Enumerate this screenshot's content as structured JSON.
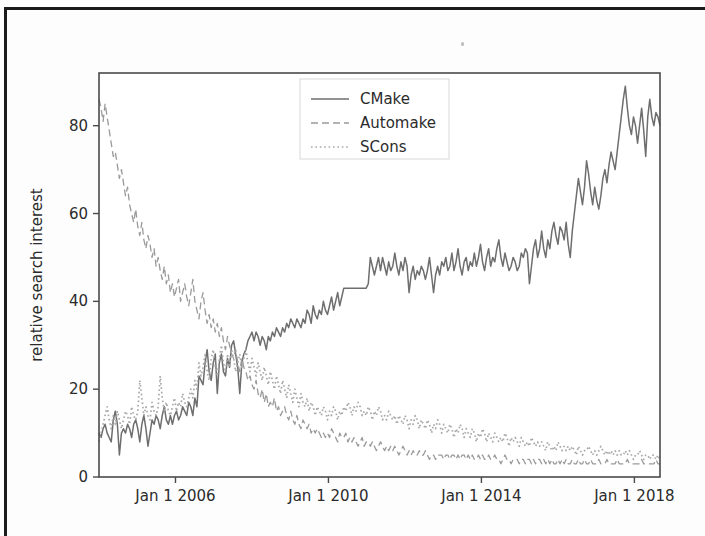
{
  "figure": {
    "background_color": "#fdfdfd",
    "frame_color": "#4a4a4a",
    "page_border_color": "#1b1b1b"
  },
  "axes": {
    "y_title": "relative search interest",
    "y_ticks": [
      "0",
      "20",
      "40",
      "60",
      "80"
    ],
    "x_ticks": [
      "Jan 1 2006",
      "Jan 1 2010",
      "Jan 1 2014",
      "Jan 1 2018"
    ]
  },
  "legend": {
    "entries": [
      {
        "label": "CMake",
        "style": "solid",
        "color": "#6e6e6e"
      },
      {
        "label": "Automake",
        "style": "dashed",
        "color": "#9a9a9a"
      },
      {
        "label": "SCons",
        "style": "dotted",
        "color": "#a8a8a8"
      }
    ]
  },
  "chart_data": {
    "type": "line",
    "title": "",
    "xlabel": "",
    "ylabel": "relative search interest",
    "xlim": [
      "2004-01-01",
      "2018-09-01"
    ],
    "ylim": [
      0,
      92
    ],
    "yticks": [
      0,
      20,
      40,
      60,
      80
    ],
    "xticks": [
      "Jan 1 2006",
      "Jan 1 2010",
      "Jan 1 2014",
      "Jan 1 2018"
    ],
    "grid": false,
    "legend_position": "upper center",
    "x_start_year": 2004.0,
    "x_end_year": 2018.67,
    "x_step_years": 0.0833,
    "series": [
      {
        "name": "CMake",
        "style": "solid",
        "color": "#6e6e6e",
        "values": [
          10,
          9,
          11,
          12,
          10,
          9,
          8,
          13,
          15,
          12,
          5,
          10,
          11,
          10,
          12,
          11,
          9,
          12,
          13,
          11,
          8,
          12,
          14,
          11,
          7,
          10,
          13,
          12,
          14,
          13,
          11,
          14,
          16,
          13,
          12,
          14,
          12,
          14,
          15,
          13,
          14,
          16,
          15,
          14,
          17,
          16,
          14,
          18,
          16,
          23,
          22,
          21,
          26,
          29,
          24,
          22,
          26,
          28,
          19,
          26,
          28,
          24,
          23,
          27,
          25,
          30,
          31,
          28,
          25,
          19,
          26,
          28,
          29,
          31,
          32,
          33,
          31,
          33,
          32,
          30,
          32,
          31,
          29,
          32,
          31,
          33,
          32,
          34,
          33,
          32,
          34,
          33,
          35,
          34,
          36,
          35,
          34,
          36,
          35,
          34,
          36,
          35,
          38,
          37,
          35,
          39,
          37,
          36,
          38,
          37,
          40,
          38,
          37,
          39,
          41,
          38,
          40,
          42,
          39,
          41,
          43,
          43,
          43,
          43,
          43,
          43,
          43,
          43,
          43,
          43,
          43,
          43,
          44,
          50,
          48,
          46,
          48,
          50,
          47,
          50,
          48,
          46,
          49,
          47,
          48,
          51,
          48,
          46,
          49,
          47,
          50,
          48,
          42,
          46,
          48,
          45,
          47,
          46,
          48,
          47,
          45,
          47,
          50,
          46,
          42,
          46,
          48,
          46,
          49,
          48,
          50,
          47,
          48,
          51,
          47,
          49,
          52,
          48,
          46,
          49,
          50,
          47,
          49,
          48,
          51,
          48,
          50,
          53,
          49,
          47,
          50,
          52,
          48,
          50,
          49,
          52,
          54,
          50,
          48,
          51,
          49,
          47,
          48,
          50,
          49,
          47,
          48,
          51,
          50,
          52,
          51,
          44,
          48,
          52,
          54,
          50,
          52,
          56,
          52,
          50,
          54,
          52,
          56,
          58,
          55,
          53,
          57,
          56,
          54,
          58,
          53,
          50,
          56,
          60,
          64,
          68,
          65,
          62,
          66,
          72,
          69,
          65,
          62,
          66,
          63,
          61,
          64,
          68,
          70,
          67,
          71,
          74,
          72,
          70,
          74,
          78,
          82,
          86,
          89,
          84,
          80,
          78,
          82,
          80,
          76,
          80,
          84,
          79,
          73,
          82,
          86,
          82,
          80,
          83,
          82,
          80
        ]
      },
      {
        "name": "Automake",
        "style": "dashed",
        "color": "#9a9a9a",
        "values": [
          86,
          84,
          81,
          85,
          82,
          79,
          76,
          73,
          74,
          71,
          68,
          70,
          67,
          64,
          66,
          62,
          60,
          58,
          61,
          57,
          55,
          58,
          54,
          52,
          55,
          53,
          50,
          52,
          48,
          50,
          47,
          45,
          48,
          44,
          46,
          42,
          44,
          41,
          43,
          45,
          40,
          42,
          44,
          41,
          39,
          42,
          45,
          40,
          38,
          36,
          40,
          42,
          38,
          35,
          37,
          34,
          36,
          33,
          35,
          32,
          34,
          31,
          29,
          32,
          30,
          28,
          27,
          29,
          26,
          24,
          27,
          25,
          24,
          22,
          23,
          21,
          20,
          22,
          19,
          18,
          20,
          17,
          19,
          16,
          17,
          16,
          18,
          15,
          16,
          14,
          15,
          16,
          14,
          13,
          15,
          13,
          12,
          14,
          12,
          11,
          13,
          12,
          11,
          12,
          10,
          11,
          10,
          11,
          10,
          9,
          10,
          9,
          10,
          9,
          11,
          10,
          9,
          8,
          10,
          9,
          9,
          10,
          8,
          9,
          8,
          9,
          8,
          7,
          8,
          9,
          7,
          8,
          8,
          7,
          8,
          7,
          6,
          7,
          8,
          7,
          6,
          7,
          6,
          7,
          6,
          7,
          6,
          5,
          6,
          7,
          6,
          5,
          6,
          5,
          6,
          5,
          5,
          6,
          5,
          5,
          6,
          5,
          4,
          5,
          5,
          4,
          5,
          5,
          5,
          4,
          5,
          5,
          4,
          5,
          5,
          4,
          5,
          4,
          5,
          5,
          4,
          5,
          4,
          5,
          4,
          4,
          5,
          4,
          5,
          4,
          4,
          5,
          4,
          4,
          5,
          4,
          4,
          3,
          4,
          5,
          4,
          4,
          3,
          4,
          4,
          4,
          3,
          4,
          4,
          3,
          4,
          4,
          3,
          4,
          3,
          4,
          4,
          3,
          4,
          3,
          4,
          3,
          4,
          3,
          3,
          4,
          3,
          4,
          3,
          4,
          3,
          3,
          4,
          3,
          3,
          4,
          3,
          3,
          4,
          3,
          3,
          4,
          3,
          3,
          3,
          4,
          3,
          3,
          3,
          4,
          3,
          3,
          3,
          3,
          4,
          3,
          3,
          3,
          3,
          4,
          3,
          3,
          3,
          3,
          3,
          3,
          4,
          3,
          3,
          3,
          3,
          3,
          3,
          4,
          3,
          3
        ]
      },
      {
        "name": "SCons",
        "style": "dotted",
        "color": "#a8a8a8",
        "values": [
          8,
          10,
          12,
          14,
          16,
          13,
          11,
          14,
          12,
          15,
          13,
          11,
          13,
          15,
          14,
          12,
          16,
          14,
          13,
          15,
          22,
          18,
          14,
          16,
          14,
          13,
          17,
          15,
          14,
          16,
          23,
          18,
          15,
          17,
          15,
          14,
          16,
          18,
          15,
          17,
          16,
          19,
          17,
          16,
          18,
          20,
          18,
          22,
          20,
          26,
          23,
          25,
          28,
          24,
          22,
          27,
          29,
          25,
          23,
          27,
          30,
          26,
          24,
          28,
          25,
          29,
          27,
          24,
          26,
          28,
          25,
          27,
          29,
          26,
          24,
          27,
          25,
          23,
          26,
          24,
          22,
          25,
          23,
          21,
          24,
          22,
          20,
          23,
          21,
          19,
          22,
          20,
          18,
          21,
          19,
          17,
          20,
          18,
          16,
          19,
          17,
          16,
          18,
          15,
          17,
          16,
          14,
          16,
          15,
          14,
          16,
          15,
          13,
          15,
          14,
          16,
          15,
          13,
          15,
          14,
          16,
          15,
          17,
          16,
          14,
          16,
          15,
          17,
          16,
          14,
          15,
          14,
          16,
          15,
          13,
          15,
          14,
          16,
          15,
          13,
          14,
          13,
          15,
          14,
          13,
          14,
          12,
          14,
          13,
          12,
          14,
          13,
          11,
          13,
          12,
          14,
          13,
          11,
          13,
          12,
          11,
          13,
          12,
          10,
          12,
          11,
          13,
          12,
          10,
          12,
          11,
          10,
          12,
          11,
          9,
          11,
          10,
          12,
          11,
          9,
          11,
          10,
          9,
          11,
          10,
          8,
          10,
          9,
          11,
          10,
          8,
          10,
          9,
          8,
          10,
          9,
          8,
          9,
          8,
          10,
          9,
          7,
          9,
          8,
          9,
          8,
          7,
          9,
          8,
          7,
          8,
          7,
          9,
          8,
          7,
          8,
          7,
          8,
          7,
          6,
          8,
          7,
          6,
          7,
          6,
          8,
          7,
          6,
          7,
          6,
          7,
          6,
          7,
          6,
          5,
          7,
          6,
          5,
          6,
          6,
          7,
          6,
          5,
          6,
          5,
          6,
          7,
          6,
          5,
          6,
          5,
          6,
          5,
          6,
          5,
          6,
          5,
          5,
          6,
          5,
          6,
          5,
          4,
          5,
          5,
          6,
          5,
          4,
          5,
          5,
          4,
          5,
          5,
          4,
          5,
          4
        ]
      }
    ]
  }
}
